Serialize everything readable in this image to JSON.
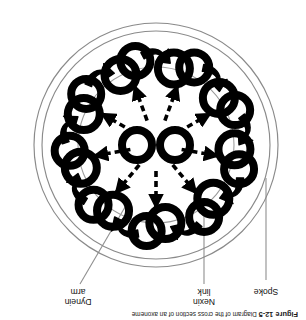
{
  "figure": {
    "caption_label": "Figure 12-5",
    "caption_text": "Diagram of the cross section of an axoneme",
    "orientation_degrees": 180,
    "background_color": "#ffffff",
    "ink_color": "#000000",
    "thin_line_color": "#8a8a8a"
  },
  "callouts": [
    {
      "id": "spoke",
      "label": "Spoke"
    },
    {
      "id": "nexin",
      "label": "Nexin\nlink"
    },
    {
      "id": "dynein",
      "label": "Dynein\narm"
    }
  ],
  "diagram": {
    "type": "axoneme-cross-section",
    "center_x": 150,
    "center_y": 175,
    "plasma_membrane": {
      "name": "plasma-membrane",
      "outer_radius": 122,
      "inner_radius": 114,
      "stroke": "#8a8a8a",
      "stroke_width": 1.1
    },
    "nexin_ring": {
      "name": "nexin-link-ring",
      "radius": 78,
      "stroke": "#9a9a9a",
      "stroke_width": 1.0
    },
    "outer_doublets": {
      "count": 9,
      "orbit_radius": 82,
      "ring_a_radius": 16,
      "ring_b_radius": 15,
      "ring_stroke_width": 8,
      "start_angle_deg": -90,
      "angles_deg": [
        -90,
        -50,
        -10,
        30,
        70,
        110,
        150,
        190,
        230
      ]
    },
    "central_pair": {
      "count": 2,
      "radius": 15,
      "stroke_width": 8,
      "offset_x": 19,
      "center_y": 175
    },
    "radial_spokes": {
      "count": 9,
      "style": "dashed",
      "dash_pattern": "6 4",
      "stroke_width": 3.6,
      "inner_radius": 26,
      "outer_radius": 62,
      "arrowheads": true
    },
    "spoke_connectors": {
      "count": 9,
      "style": "solid",
      "stroke_width": 2.4,
      "description": "solid segment joining each dashed spoke to its outer doublet"
    },
    "dynein_arms": {
      "count": 9,
      "shape": "hook",
      "fill": "#000000"
    }
  }
}
